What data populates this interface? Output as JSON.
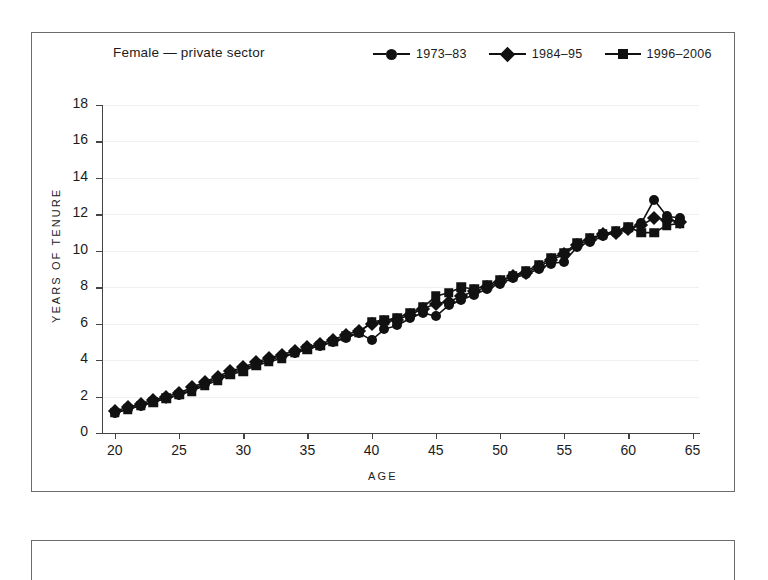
{
  "panel": {
    "title": "Female — private sector"
  },
  "legend": {
    "position": "top-right",
    "items": [
      {
        "label": "1973–83",
        "marker": "circle-marker-icon"
      },
      {
        "label": "1984–95",
        "marker": "diamond-marker-icon"
      },
      {
        "label": "1996–2006",
        "marker": "square-marker-icon"
      }
    ]
  },
  "chart_data": {
    "type": "line",
    "title": "Female — private sector",
    "xlabel": "AGE",
    "ylabel": "YEARS OF TENURE",
    "xlim": [
      19,
      65.5
    ],
    "ylim": [
      0,
      18
    ],
    "xticks": [
      20,
      25,
      30,
      35,
      40,
      45,
      50,
      55,
      60,
      65
    ],
    "yticks": [
      0,
      2,
      4,
      6,
      8,
      10,
      12,
      14,
      16,
      18
    ],
    "grid": "horizontal-faint",
    "legend_position": "top-right",
    "x": [
      20,
      21,
      22,
      23,
      24,
      25,
      26,
      27,
      28,
      29,
      30,
      31,
      32,
      33,
      34,
      35,
      36,
      37,
      38,
      39,
      40,
      41,
      42,
      43,
      44,
      45,
      46,
      47,
      48,
      49,
      50,
      51,
      52,
      53,
      54,
      55,
      56,
      57,
      58,
      59,
      60,
      61,
      62,
      63,
      64
    ],
    "series": [
      {
        "name": "1973–83",
        "marker": "circle",
        "color": "#111111",
        "values": [
          1.1,
          1.3,
          1.5,
          1.7,
          1.9,
          2.1,
          2.4,
          2.7,
          3.0,
          3.3,
          3.5,
          3.8,
          4.0,
          4.2,
          4.4,
          4.6,
          4.8,
          5.0,
          5.2,
          5.5,
          5.1,
          5.7,
          5.9,
          6.3,
          6.6,
          6.4,
          7.0,
          7.3,
          7.6,
          7.9,
          8.2,
          8.5,
          8.7,
          9.0,
          9.3,
          9.4,
          10.2,
          10.5,
          10.8,
          11.0,
          11.2,
          11.5,
          12.8,
          11.9,
          11.8
        ]
      },
      {
        "name": "1984–95",
        "marker": "diamond",
        "color": "#111111",
        "values": [
          1.2,
          1.4,
          1.6,
          1.8,
          2.0,
          2.2,
          2.5,
          2.8,
          3.1,
          3.4,
          3.6,
          3.9,
          4.1,
          4.3,
          4.5,
          4.7,
          4.9,
          5.1,
          5.4,
          5.6,
          6.0,
          6.1,
          6.2,
          6.5,
          6.8,
          7.1,
          7.2,
          7.5,
          7.8,
          8.0,
          8.3,
          8.6,
          8.8,
          9.1,
          9.5,
          9.8,
          10.3,
          10.6,
          10.9,
          11.0,
          11.2,
          11.4,
          11.8,
          11.7,
          11.6
        ]
      },
      {
        "name": "1996–2006",
        "marker": "square",
        "color": "#111111",
        "values": [
          1.1,
          1.3,
          1.5,
          1.7,
          1.9,
          2.1,
          2.3,
          2.6,
          2.9,
          3.2,
          3.4,
          3.7,
          3.9,
          4.1,
          4.4,
          4.6,
          4.8,
          5.0,
          5.3,
          5.5,
          6.1,
          6.2,
          6.3,
          6.6,
          6.9,
          7.5,
          7.7,
          8.0,
          7.9,
          8.1,
          8.4,
          8.6,
          8.9,
          9.2,
          9.6,
          9.9,
          10.4,
          10.7,
          10.9,
          11.1,
          11.3,
          11.0,
          11.0,
          11.4,
          11.5
        ]
      }
    ]
  }
}
